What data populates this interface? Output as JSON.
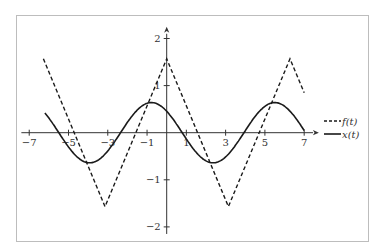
{
  "chart_data": {
    "type": "line",
    "title": "",
    "xlabel": "",
    "ylabel": "",
    "xlim": [
      -7.4,
      7.7
    ],
    "ylim": [
      -2.15,
      2.25
    ],
    "grid": false,
    "legend_position": "right, beside the x-axis",
    "x_ticks": [
      -7,
      -5,
      -3,
      -1,
      1,
      3,
      5,
      7
    ],
    "x_tick_labels": [
      "−7",
      "−5",
      "−3",
      "−1",
      "1",
      "3",
      "5",
      "7"
    ],
    "y_ticks": [
      2,
      1,
      -1,
      -2
    ],
    "y_tick_labels": [
      "2",
      "1",
      "−1",
      "−2"
    ],
    "series": [
      {
        "name": "f(t)",
        "style": "dashed",
        "description": "triangle wave, period 2π, peak π/2 at t = 0, ±2π; trough −π/2 at t = ±π",
        "x": [
          -6.28,
          -3.14,
          0,
          3.14,
          6.28,
          7
        ],
        "values": [
          1.57,
          -1.57,
          1.57,
          -1.57,
          1.57,
          0.85
        ]
      },
      {
        "name": "x(t)",
        "style": "solid",
        "description": "sinusoid ≈ 0.64·cos(t + 0.78), period 2π",
        "x": [
          -6.2,
          -5.5,
          -4.0,
          -2.4,
          -0.8,
          0.9,
          2.35,
          3.95,
          5.5,
          7
        ],
        "values": [
          0.42,
          0.0,
          -0.64,
          0.0,
          0.64,
          0.0,
          -0.64,
          0.0,
          0.64,
          0.05
        ]
      }
    ]
  },
  "legend": {
    "items": [
      {
        "label": "f(t)",
        "style": "dashed"
      },
      {
        "label": "x(t)",
        "style": "solid"
      }
    ]
  },
  "colors": {
    "line": "#1a1a1a",
    "axis": "#333333",
    "frame": "#bdbdbd",
    "background": "#ffffff"
  }
}
